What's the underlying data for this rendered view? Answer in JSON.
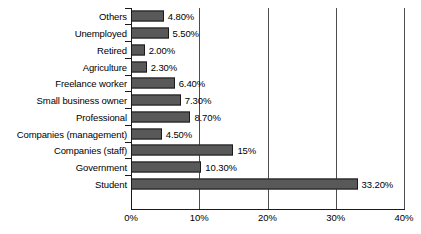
{
  "chart_data": {
    "type": "bar",
    "orientation": "horizontal",
    "title": "",
    "xlabel": "",
    "ylabel": "",
    "xlim": [
      0,
      40
    ],
    "xticks": [
      "0%",
      "10%",
      "20%",
      "30%",
      "40%"
    ],
    "xtick_values": [
      0,
      10,
      20,
      30,
      40
    ],
    "grid": "vertical",
    "legend": "none",
    "bar_color": "#595959",
    "bar_edge_color": "#1a1a1a",
    "axis_color": "#1a1a1a",
    "categories": [
      "Others",
      "Unemployed",
      "Retired",
      "Agriculture",
      "Freelance worker",
      "Small business owner",
      "Professional",
      "Companies (management)",
      "Companies (staff)",
      "Government",
      "Student"
    ],
    "values": [
      4.8,
      5.5,
      2.0,
      2.3,
      6.4,
      7.3,
      8.7,
      4.5,
      15.0,
      10.3,
      33.2
    ],
    "value_labels": [
      "4.80%",
      "5.50%",
      "2.00%",
      "2.30%",
      "6.40%",
      "7.30%",
      "8.70%",
      "4.50%",
      "15%",
      "10.30%",
      "33.20%"
    ]
  }
}
